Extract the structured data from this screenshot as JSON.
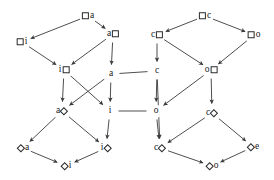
{
  "diagram": {
    "type": "directed-acyclic-graph",
    "width": 274,
    "height": 180,
    "background_color": "#ffffff",
    "edge_color": "#3a3a3a",
    "node_text_color": "#1a1a1a",
    "shape_glyphs": {
      "box": "□",
      "diamond": "◇"
    },
    "nodes": [
      {
        "id": "box_a",
        "label": "□a",
        "letter": "a",
        "shape": "box",
        "shape_side": "left",
        "x": 88,
        "y": 16
      },
      {
        "id": "box_i",
        "label": "□i",
        "letter": "i",
        "shape": "box",
        "shape_side": "left",
        "x": 22,
        "y": 42
      },
      {
        "id": "a_box",
        "label": "a□",
        "letter": "a",
        "shape": "box",
        "shape_side": "right",
        "x": 113,
        "y": 34
      },
      {
        "id": "i_box",
        "label": "i□",
        "letter": "i",
        "shape": "box",
        "shape_side": "right",
        "x": 64,
        "y": 70
      },
      {
        "id": "a_plain",
        "label": "a",
        "letter": "a",
        "shape": "none",
        "shape_side": "none",
        "x": 111,
        "y": 74
      },
      {
        "id": "box_c",
        "label": "□c",
        "letter": "c",
        "shape": "box",
        "shape_side": "left",
        "x": 205,
        "y": 16
      },
      {
        "id": "c_box",
        "label": "c□",
        "letter": "c",
        "shape": "box",
        "shape_side": "right",
        "x": 157,
        "y": 35
      },
      {
        "id": "box_o",
        "label": "□o",
        "letter": "o",
        "shape": "box",
        "shape_side": "left",
        "x": 254,
        "y": 35
      },
      {
        "id": "c_plain",
        "label": "c",
        "letter": "c",
        "shape": "none",
        "shape_side": "none",
        "x": 157,
        "y": 71
      },
      {
        "id": "o_box",
        "label": "o□",
        "letter": "o",
        "shape": "box",
        "shape_side": "right",
        "x": 211,
        "y": 70
      },
      {
        "id": "a_dia",
        "label": "a◇",
        "letter": "a",
        "shape": "diamond",
        "shape_side": "right",
        "x": 62,
        "y": 111
      },
      {
        "id": "i_plain",
        "label": "i",
        "letter": "i",
        "shape": "none",
        "shape_side": "none",
        "x": 110,
        "y": 111
      },
      {
        "id": "o_plain",
        "label": "o",
        "letter": "o",
        "shape": "none",
        "shape_side": "none",
        "x": 156,
        "y": 111
      },
      {
        "id": "c_dia_hi",
        "label": "c◇",
        "letter": "c",
        "shape": "diamond",
        "shape_side": "right",
        "x": 212,
        "y": 113
      },
      {
        "id": "dia_a",
        "label": "◇a",
        "letter": "a",
        "shape": "diamond",
        "shape_side": "left",
        "x": 23,
        "y": 148
      },
      {
        "id": "i_dia",
        "label": "i◇",
        "letter": "i",
        "shape": "diamond",
        "shape_side": "right",
        "x": 106,
        "y": 148
      },
      {
        "id": "c_dia_lo",
        "label": "c◇",
        "letter": "c",
        "shape": "diamond",
        "shape_side": "right",
        "x": 160,
        "y": 148
      },
      {
        "id": "dia_e",
        "label": "◇e",
        "letter": "e",
        "shape": "diamond",
        "shape_side": "left",
        "x": 253,
        "y": 147
      },
      {
        "id": "dia_i",
        "label": "◇i",
        "letter": "i",
        "shape": "diamond",
        "shape_side": "left",
        "x": 66,
        "y": 166
      },
      {
        "id": "dia_o",
        "label": "◇o",
        "letter": "o",
        "shape": "diamond",
        "shape_side": "left",
        "x": 212,
        "y": 166
      }
    ],
    "edges": [
      {
        "from": "box_a",
        "to": "box_i",
        "arrow": true
      },
      {
        "from": "box_a",
        "to": "a_box",
        "arrow": true
      },
      {
        "from": "box_i",
        "to": "i_box",
        "arrow": true
      },
      {
        "from": "a_box",
        "to": "i_box",
        "arrow": true
      },
      {
        "from": "a_box",
        "to": "a_plain",
        "arrow": true
      },
      {
        "from": "box_c",
        "to": "c_box",
        "arrow": true
      },
      {
        "from": "box_c",
        "to": "box_o",
        "arrow": true
      },
      {
        "from": "c_box",
        "to": "o_box",
        "arrow": true
      },
      {
        "from": "c_box",
        "to": "c_plain",
        "arrow": true
      },
      {
        "from": "box_o",
        "to": "o_box",
        "arrow": true
      },
      {
        "from": "a_plain",
        "to": "i_plain",
        "arrow": true
      },
      {
        "from": "a_plain",
        "to": "a_dia",
        "arrow": true
      },
      {
        "from": "a_plain",
        "to": "c_plain",
        "arrow": false
      },
      {
        "from": "i_box",
        "to": "i_plain",
        "arrow": true
      },
      {
        "from": "i_box",
        "to": "a_dia",
        "arrow": true
      },
      {
        "from": "c_plain",
        "to": "o_plain",
        "arrow": true
      },
      {
        "from": "c_plain",
        "to": "c_dia_lo",
        "arrow": true
      },
      {
        "from": "o_box",
        "to": "o_plain",
        "arrow": true
      },
      {
        "from": "o_box",
        "to": "c_dia_hi",
        "arrow": true
      },
      {
        "from": "i_plain",
        "to": "i_dia",
        "arrow": true
      },
      {
        "from": "i_plain",
        "to": "o_plain",
        "arrow": false
      },
      {
        "from": "a_dia",
        "to": "dia_a",
        "arrow": true
      },
      {
        "from": "a_dia",
        "to": "i_dia",
        "arrow": true
      },
      {
        "from": "o_plain",
        "to": "c_dia_lo",
        "arrow": true
      },
      {
        "from": "c_dia_hi",
        "to": "c_dia_lo",
        "arrow": true
      },
      {
        "from": "c_dia_hi",
        "to": "dia_e",
        "arrow": true
      },
      {
        "from": "dia_a",
        "to": "dia_i",
        "arrow": true
      },
      {
        "from": "i_dia",
        "to": "dia_i",
        "arrow": true
      },
      {
        "from": "c_dia_lo",
        "to": "dia_o",
        "arrow": true
      },
      {
        "from": "dia_e",
        "to": "dia_o",
        "arrow": true
      }
    ]
  }
}
